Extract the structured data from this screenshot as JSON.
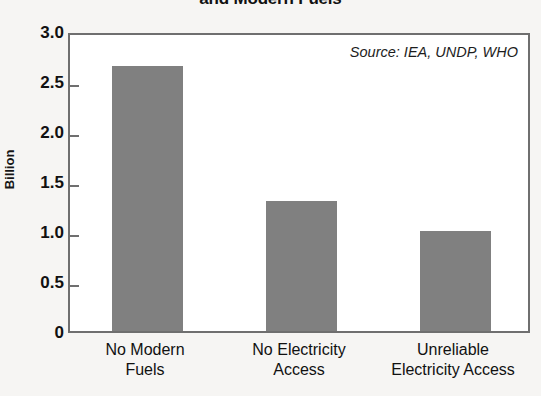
{
  "chart_data": {
    "type": "bar",
    "title": "and Modern Fuels",
    "subtitle": "",
    "xlabel": "",
    "ylabel": "Billion",
    "categories": [
      "No Modern Fuels",
      "No Electricity Access",
      "Unreliable Electricity Access"
    ],
    "category_lines": [
      [
        "No Modern",
        "Fuels"
      ],
      [
        "No Electricity",
        "Access"
      ],
      [
        "Unreliable",
        "Electricity Access"
      ]
    ],
    "values": [
      2.65,
      1.3,
      1.0
    ],
    "ylim": [
      0,
      3.0
    ],
    "yticks": [
      0,
      0.5,
      1.0,
      1.5,
      2.0,
      2.5,
      3.0
    ],
    "ytick_labels": [
      "0",
      "0.5",
      "1.0",
      "1.5",
      "2.0",
      "2.5",
      "3.0"
    ],
    "grid": false,
    "legend": false,
    "bar_color": "#808080",
    "frame_color": "#6f6f6f",
    "annotations": [
      "Source: IEA, UNDP, WHO"
    ]
  },
  "annotation": {
    "source": "Source: IEA, UNDP, WHO"
  },
  "axis": {
    "y_title": "Billion"
  }
}
